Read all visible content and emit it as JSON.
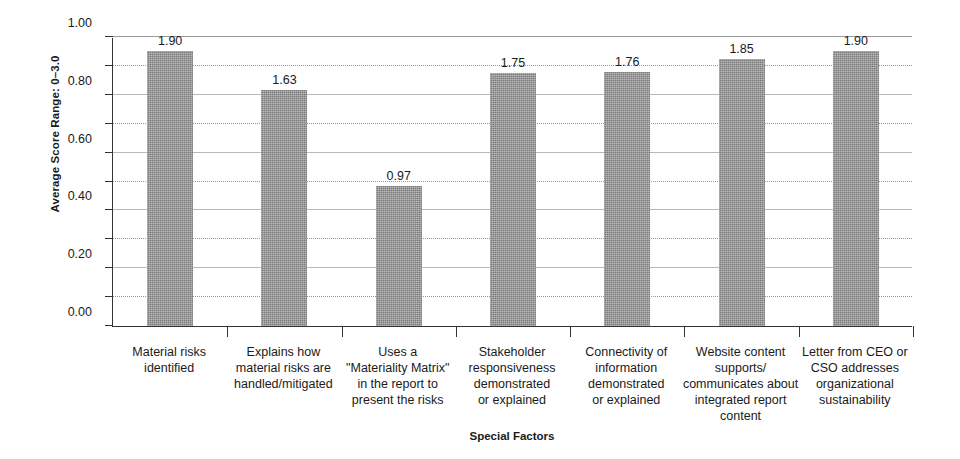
{
  "chart_data": {
    "type": "bar",
    "title": "",
    "xlabel": "Special Factors",
    "ylabel": "Average Score Range: 0–3.0",
    "ylim": [
      0,
      2.0
    ],
    "ytick_step": 0.2,
    "grid": true,
    "legend": "none",
    "bar_color": "#7c7c7c",
    "categories": [
      "Material risks identified",
      "Explains how material risks are handled/mitigated",
      "Uses a \"Materiality Matrix\" in the report to present the risks",
      "Stakeholder responsiveness demonstrated or explained",
      "Connectivity of information demonstrated or explained",
      "Website content supports/ communicates about integrated report content",
      "Letter from CEO or CSO addresses organizational sustainability"
    ],
    "category_lines": [
      [
        "Material risks",
        "identified"
      ],
      [
        "Explains how",
        "material risks are",
        "handled/mitigated"
      ],
      [
        "Uses a",
        "\"Materiality Matrix\"",
        "in the report to",
        "present the risks"
      ],
      [
        "Stakeholder",
        "responsiveness",
        "demonstrated",
        "or explained"
      ],
      [
        "Connectivity of",
        "information",
        "demonstrated",
        "or explained"
      ],
      [
        "Website content",
        "supports/",
        "communicates about",
        "integrated report",
        "content"
      ],
      [
        "Letter from CEO or",
        "CSO addresses",
        "organizational",
        "sustainability"
      ]
    ],
    "values": [
      1.9,
      1.63,
      0.97,
      1.75,
      1.76,
      1.85,
      1.9
    ],
    "value_labels": [
      "1.90",
      "1.63",
      "0.97",
      "1.75",
      "1.76",
      "1.85",
      "1.90"
    ],
    "ytick_labels": [
      "0.00",
      "0.20",
      "0.40",
      "0.60",
      "0.80",
      "1.00",
      "1.20",
      "1.40",
      "1.60",
      "1.80",
      "2.00"
    ],
    "ytick_values": [
      0.0,
      0.2,
      0.4,
      0.6,
      0.8,
      1.0,
      1.2,
      1.4,
      1.6,
      1.8,
      2.0
    ]
  }
}
